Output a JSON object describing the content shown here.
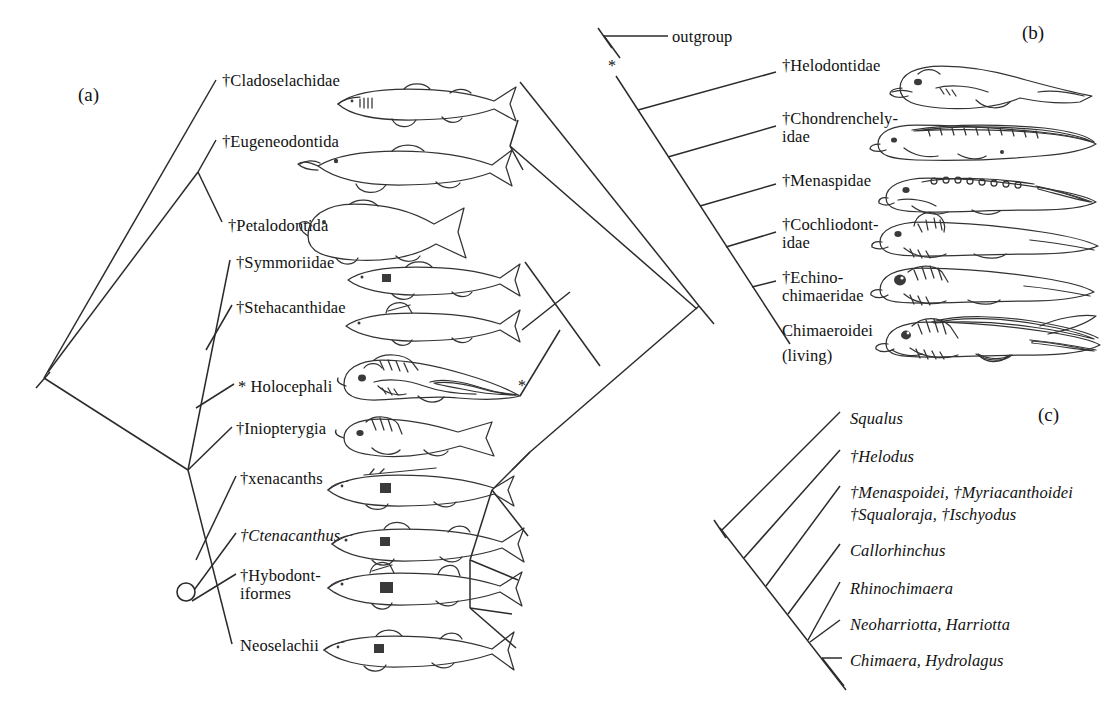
{
  "figure": {
    "panels": [
      {
        "tag": "(a)",
        "tag_pos": {
          "x": 78,
          "y": 84
        },
        "kind": "cladogram-mirrored",
        "taxa": [
          {
            "label": "†Cladoselachidae",
            "italic": false,
            "x": 222,
            "y": 80,
            "art": "shark-cladoselache"
          },
          {
            "label": "†Eugeneodontida",
            "italic": false,
            "x": 222,
            "y": 141,
            "art": "shark-eugeneodont"
          },
          {
            "label": "†Petalodontida",
            "italic": false,
            "x": 228,
            "y": 225,
            "art": "fish-petalodont"
          },
          {
            "label": "†Symmoriidae",
            "italic": false,
            "x": 236,
            "y": 262,
            "art": "shark-symmoriid"
          },
          {
            "label": "†Stehacanthidae",
            "italic": false,
            "x": 236,
            "y": 307,
            "art": "shark-stethacanthid"
          },
          {
            "label": "* Holocephali",
            "italic": false,
            "x": 238,
            "y": 386,
            "art": "chimaera-holocephali"
          },
          {
            "label": "†Iniopterygia",
            "italic": false,
            "x": 236,
            "y": 428,
            "art": "fish-iniopterygian"
          },
          {
            "label": "†xenacanths",
            "italic": false,
            "x": 240,
            "y": 478,
            "art": "shark-xenacanth"
          },
          {
            "label": "†Ctenacanthus",
            "italic": true,
            "x": 240,
            "y": 535,
            "art": "shark-ctenacanth"
          },
          {
            "label": "†Hybodont-",
            "italic": false,
            "x": 240,
            "y": 575,
            "art": "shark-hybodont",
            "label2": "iformes",
            "y2": 593
          },
          {
            "label": "Neoselachii",
            "italic": false,
            "x": 240,
            "y": 645,
            "art": "shark-neoselachian"
          }
        ],
        "markers": [
          {
            "type": "node-circle",
            "x": 186,
            "y": 592,
            "r": 9
          },
          {
            "type": "asterisk",
            "symbol": "*",
            "x": 518,
            "y": 384
          }
        ]
      },
      {
        "tag": "(b)",
        "tag_pos": {
          "x": 1022,
          "y": 22
        },
        "kind": "cladogram-comb",
        "root_stub_label": "outgroup",
        "root_stub_pos": {
          "x": 672,
          "y": 38
        },
        "taxa": [
          {
            "label": "†Helodontidae",
            "italic": false,
            "x": 782,
            "y": 65,
            "art": "chimaera-helodont"
          },
          {
            "label": "†Chondrenchely-",
            "italic": false,
            "x": 782,
            "y": 118,
            "label2": "idae",
            "y2": 136,
            "art": "chimaera-chondrenchelyid"
          },
          {
            "label": "†Menaspidae",
            "italic": false,
            "x": 782,
            "y": 180,
            "art": "chimaera-menaspid"
          },
          {
            "label": "†Cochliodont-",
            "italic": false,
            "x": 782,
            "y": 224,
            "label2": "idae",
            "y2": 242,
            "art": "chimaera-cochliodont"
          },
          {
            "label": "†Echino-",
            "italic": false,
            "x": 782,
            "y": 277,
            "label2": "chimaeridae",
            "y2": 295,
            "art": "chimaera-echinochimaerid"
          },
          {
            "label": "Chimaeroidei",
            "italic": false,
            "x": 782,
            "y": 330,
            "label2": "(living)",
            "y2": 355,
            "art": "chimaera-living"
          }
        ],
        "markers": [
          {
            "type": "asterisk",
            "symbol": "*",
            "x": 608,
            "y": 64
          }
        ]
      },
      {
        "tag": "(c)",
        "tag_pos": {
          "x": 1038,
          "y": 404
        },
        "kind": "cladogram-comb",
        "taxa": [
          {
            "label": "Squalus",
            "italic": true,
            "x": 850,
            "y": 418
          },
          {
            "label": "†Helodus",
            "italic": true,
            "x": 850,
            "y": 456
          },
          {
            "label": "†Menaspoidei, †Myriacanthoidei",
            "italic": true,
            "x": 850,
            "y": 492,
            "label2": "†Squaloraja, †Ischyodus",
            "y2": 514
          },
          {
            "label": "Callorhinchus",
            "italic": true,
            "x": 850,
            "y": 550
          },
          {
            "label": "Rhinochimaera",
            "italic": true,
            "x": 850,
            "y": 588
          },
          {
            "label": "Neoharriotta, Harriotta",
            "italic": true,
            "x": 850,
            "y": 624
          },
          {
            "label": "Chimaera, Hydrolagus",
            "italic": true,
            "x": 850,
            "y": 660
          }
        ]
      }
    ],
    "colors": {
      "line": "#2b2b2b",
      "art_stroke": "#333333",
      "text": "#111111",
      "background": "#ffffff"
    }
  }
}
